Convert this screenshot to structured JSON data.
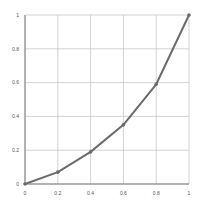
{
  "chart_data": {
    "type": "line",
    "title": "",
    "xlabel": "",
    "ylabel": "",
    "x": [
      0,
      0.2,
      0.4,
      0.6,
      0.8,
      1
    ],
    "series": [
      {
        "name": "series1",
        "values": [
          0,
          0.07,
          0.19,
          0.35,
          0.59,
          1
        ],
        "color": "#6b6b6b"
      }
    ],
    "xlim": [
      0,
      1
    ],
    "ylim": [
      0,
      1
    ],
    "xticks": [
      "0",
      "0.2",
      "0.4",
      "0.6",
      "0.8",
      "1"
    ],
    "yticks": [
      "0",
      "0.2",
      "0.4",
      "0.6",
      "0.8",
      "1"
    ],
    "grid": true,
    "legend": "none"
  },
  "colors": {
    "line": "#6b6b6b",
    "marker": "#6b6b6b",
    "grid": "#c8c8c8",
    "axis": "#7a7a7a",
    "background": "#ffffff"
  }
}
